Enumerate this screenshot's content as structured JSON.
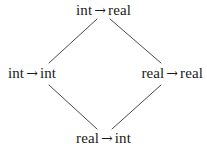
{
  "diagram": {
    "kind": "lattice-diagram",
    "arrow_glyph": "→",
    "line_color": "#4a4a4a",
    "text_color": "#1a1a1a",
    "background_color": "#ffffff",
    "nodes": [
      {
        "id": "top",
        "label": "int → real",
        "domain": "int",
        "codomain": "real",
        "position": "top"
      },
      {
        "id": "left",
        "label": "int → int",
        "domain": "int",
        "codomain": "int",
        "position": "left"
      },
      {
        "id": "right",
        "label": "real → real",
        "domain": "real",
        "codomain": "real",
        "position": "right"
      },
      {
        "id": "bottom",
        "label": "real → int",
        "domain": "real",
        "codomain": "int",
        "position": "bottom"
      }
    ],
    "edges": [
      {
        "id": "top-left",
        "from": "top",
        "to": "left"
      },
      {
        "id": "top-right",
        "from": "top",
        "to": "right"
      },
      {
        "id": "left-bottom",
        "from": "left",
        "to": "bottom"
      },
      {
        "id": "right-bottom",
        "from": "right",
        "to": "bottom"
      }
    ]
  }
}
